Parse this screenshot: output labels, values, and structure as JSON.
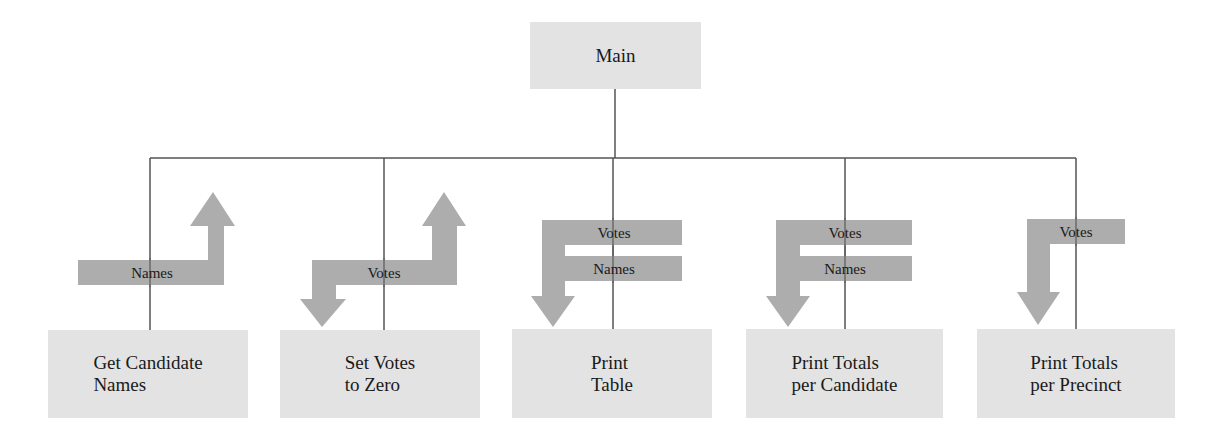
{
  "diagram": {
    "type": "structure-chart",
    "colors": {
      "box_fill": "#e3e3e3",
      "arrow_fill": "#a6a6a6",
      "line": "#555555",
      "text": "#1a1a1a"
    },
    "root": {
      "label": "Main"
    },
    "modules": [
      {
        "id": "get-candidate-names",
        "label": "Get Candidate\nNames",
        "flows": [
          {
            "label": "Names",
            "direction": "up"
          }
        ]
      },
      {
        "id": "set-votes-to-zero",
        "label": "Set Votes\nto Zero",
        "flows": [
          {
            "label": "Votes",
            "direction": "in-out"
          }
        ]
      },
      {
        "id": "print-table",
        "label": "Print\nTable",
        "flows": [
          {
            "label": "Votes",
            "direction": "down"
          },
          {
            "label": "Names",
            "direction": "down"
          }
        ]
      },
      {
        "id": "print-totals-per-candidate",
        "label": "Print Totals\nper Candidate",
        "flows": [
          {
            "label": "Votes",
            "direction": "down"
          },
          {
            "label": "Names",
            "direction": "down"
          }
        ]
      },
      {
        "id": "print-totals-per-precinct",
        "label": "Print Totals\nper Precinct",
        "flows": [
          {
            "label": "Votes",
            "direction": "down"
          }
        ]
      }
    ]
  }
}
